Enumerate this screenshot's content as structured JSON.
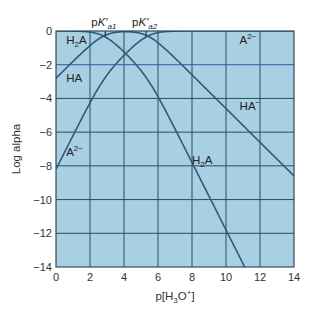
{
  "chart_data": {
    "type": "line",
    "title": "",
    "xlabel": "p[H3O+]",
    "ylabel": "Log alpha",
    "xlim": [
      0,
      14
    ],
    "ylim": [
      -14,
      0
    ],
    "grid": true,
    "x_ticks": [
      0,
      2,
      4,
      6,
      8,
      10,
      12,
      14
    ],
    "y_ticks": [
      0,
      -2,
      -4,
      -6,
      -8,
      -10,
      -12,
      -14
    ],
    "x_tick_labels": [
      "0",
      "2",
      "4",
      "6",
      "8",
      "10",
      "12",
      "14"
    ],
    "y_tick_labels": [
      "0",
      "−2",
      "−4",
      "−6",
      "−8",
      "−10",
      "−12",
      "−14"
    ],
    "pKa_markers": [
      {
        "label_main": "pK′",
        "label_sub": "a1",
        "x": 2.9
      },
      {
        "label_main": "pK′",
        "label_sub": "a2",
        "x": 5.3
      }
    ],
    "pKa1": 2.8,
    "pKa2": 5.4,
    "series": [
      {
        "name": "H2A",
        "x": [
          0,
          1,
          2,
          3,
          4,
          5,
          6,
          7,
          8,
          9,
          10,
          11
        ],
        "values": [
          -0.0,
          -0.02,
          -0.16,
          -0.51,
          -1.19,
          -2.22,
          -3.62,
          -5.2,
          -7.2,
          -9.2,
          -11.2,
          -13.2
        ]
      },
      {
        "name": "HA-",
        "x": [
          0,
          1,
          2,
          3,
          4,
          5,
          6,
          7,
          8,
          9,
          10,
          11,
          12,
          13,
          14
        ],
        "values": [
          -2.8,
          -1.82,
          -0.96,
          -0.31,
          -0.19,
          -0.42,
          -0.82,
          -1.7,
          -2.6,
          -3.6,
          -4.6,
          -5.6,
          -6.6,
          -7.6,
          -8.6
        ]
      },
      {
        "name": "A2-",
        "x": [
          0,
          1,
          2,
          3,
          4,
          5,
          6,
          7,
          8,
          9,
          10,
          11,
          12,
          13,
          14
        ],
        "values": [
          -8.2,
          -6.22,
          -4.36,
          -2.71,
          -1.59,
          -0.82,
          -0.22,
          -0.04,
          -0.0,
          -0.0,
          -0.0,
          -0.0,
          -0.0,
          -0.0,
          -0.0
        ]
      }
    ],
    "annotations": [
      {
        "text_main": "H",
        "text_sub": "2",
        "text_tail": "A",
        "x": 0.6,
        "y": -0.75
      },
      {
        "text_main": "HA",
        "text_sub": "",
        "text_tail": "",
        "x": 0.6,
        "y": -3.0
      },
      {
        "text_main": "A",
        "text_sup": "2−",
        "x": 0.6,
        "y": -7.4
      },
      {
        "text_main": "A",
        "text_sup": "2−",
        "x": 10.8,
        "y": -0.75
      },
      {
        "text_main": "HA",
        "text_sup": "−",
        "x": 10.8,
        "y": -4.7
      },
      {
        "text_main": "H",
        "text_sub": "2",
        "text_tail": "A",
        "x": 8.0,
        "y": -7.9
      }
    ],
    "colors": {
      "plot_background": "#a8cfe2",
      "grid": "#2f4c5c",
      "grid_highlight": "#3a56a8",
      "curve": "#2c5d7a",
      "border": "#2f4c5c"
    }
  },
  "axes": {
    "ylabel": "Log alpha",
    "xlabel_main": "p[H",
    "xlabel_sub": "3",
    "xlabel_mid": "O",
    "xlabel_sup": "+",
    "xlabel_tail": "]"
  }
}
